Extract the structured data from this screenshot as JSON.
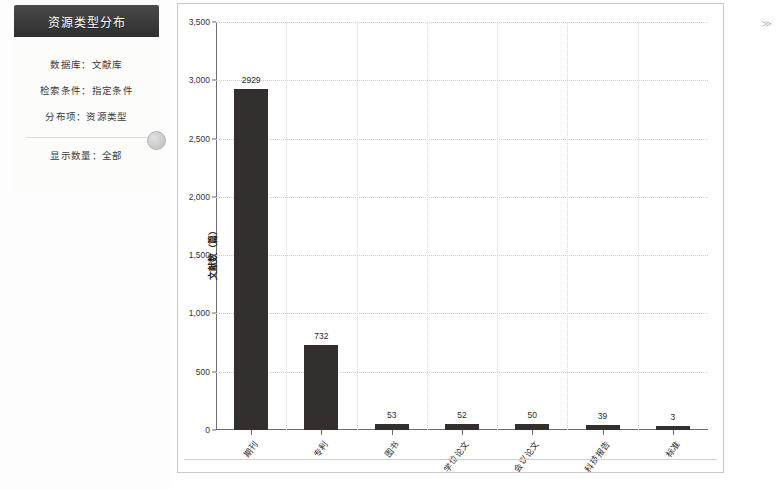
{
  "panel": {
    "title": "资源类型分布",
    "rows": [
      "数据库：文献库",
      "检索条件：指定条件",
      "分布项：资源类型"
    ],
    "footer_row": "显示数量：全部",
    "knob_icon": "circle-handle-icon"
  },
  "edge": {
    "mark": "≫"
  },
  "chart_data": {
    "type": "bar",
    "title": "资源类型分布",
    "xlabel": "",
    "ylabel": "文献数（篇）",
    "categories": [
      "期刊",
      "专利",
      "图书",
      "学位论文",
      "会议论文",
      "科技报告",
      "标准"
    ],
    "values": [
      2929,
      732,
      53,
      52,
      50,
      39,
      3
    ],
    "ylim": [
      0,
      3500
    ],
    "yticks": [
      0,
      500,
      1000,
      1500,
      2000,
      2500,
      3000,
      3500
    ],
    "ytick_labels": [
      "0",
      "500",
      "1,000",
      "1,500",
      "2,000",
      "2,500",
      "3,000",
      "3,500"
    ],
    "grid": true,
    "legend": "none",
    "bar_color": "#332f2f",
    "axis_color": "#6d6d6d",
    "grid_color": "#cfcfcf"
  }
}
